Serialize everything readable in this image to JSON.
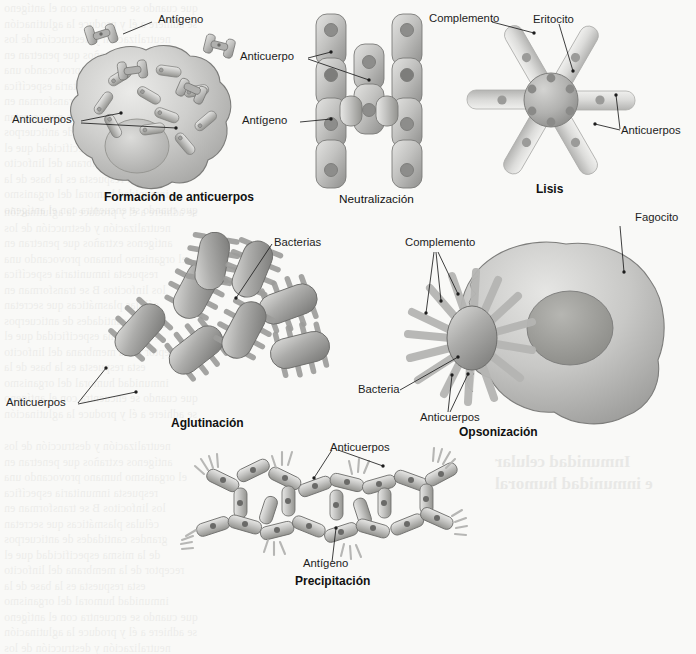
{
  "figure": {
    "background_color": "#f9f9f7",
    "ink_color": "#1d1d1d",
    "art_light": "#e2e2e0",
    "art_mid": "#b9b9b7",
    "art_dark": "#8e8e8c",
    "art_shadow": "#6f6f6d"
  },
  "panels": [
    {
      "id": "formacion",
      "caption": "Formación de anticuerpos",
      "caption_bold": true,
      "labels": [
        {
          "text": "Antígeno",
          "name": "label-antigeno"
        },
        {
          "text": "Anticuerpos",
          "name": "label-anticuerpos"
        }
      ]
    },
    {
      "id": "neutralizacion",
      "caption": "Neutralización",
      "caption_bold": false,
      "labels": [
        {
          "text": "Anticuerpo",
          "name": "label-anticuerpo"
        },
        {
          "text": "Antígeno",
          "name": "label-antigeno"
        }
      ]
    },
    {
      "id": "lisis",
      "caption": "Lisis",
      "caption_bold": true,
      "labels": [
        {
          "text": "Complemento",
          "name": "label-complemento"
        },
        {
          "text": "Eritocito",
          "name": "label-eritocito"
        },
        {
          "text": "Anticuerpos",
          "name": "label-anticuerpos"
        }
      ]
    },
    {
      "id": "aglutinacion",
      "caption": "Aglutinación",
      "caption_bold": true,
      "labels": [
        {
          "text": "Bacterias",
          "name": "label-bacterias"
        },
        {
          "text": "Anticuerpos",
          "name": "label-anticuerpos"
        }
      ]
    },
    {
      "id": "opsonizacion",
      "caption": "Opsonización",
      "caption_bold": true,
      "labels": [
        {
          "text": "Complemento",
          "name": "label-complemento"
        },
        {
          "text": "Fagocito",
          "name": "label-fagocito"
        },
        {
          "text": "Bacteria",
          "name": "label-bacteria"
        },
        {
          "text": "Anticuerpos",
          "name": "label-anticuerpos"
        }
      ]
    },
    {
      "id": "precipitacion",
      "caption": "Precipitación",
      "caption_bold": true,
      "labels": [
        {
          "text": "Anticuerpos",
          "name": "label-anticuerpos"
        },
        {
          "text": "Antígeno",
          "name": "label-antigeno"
        }
      ]
    }
  ],
  "background_text": {
    "lines": [
      "que cuando se encuentra con el antígeno",
      "se adhiere a él y produce la aglutinación",
      "neutralización y destrucción de los",
      "antígenos extraños que penetran en",
      "el organismo humano provocando una",
      "respuesta inmunitaria específica",
      "los linfocitos B se transforman en",
      "células plasmáticas que secretan",
      "grandes cantidades de anticuerpos",
      "de la misma especificidad que el",
      "receptor de la membrana del linfocito",
      "esta respuesta es la base de la",
      "inmunidad humoral del organismo"
    ],
    "headings": [
      "Inmunidad celular",
      "e inmunidad humoral"
    ]
  }
}
